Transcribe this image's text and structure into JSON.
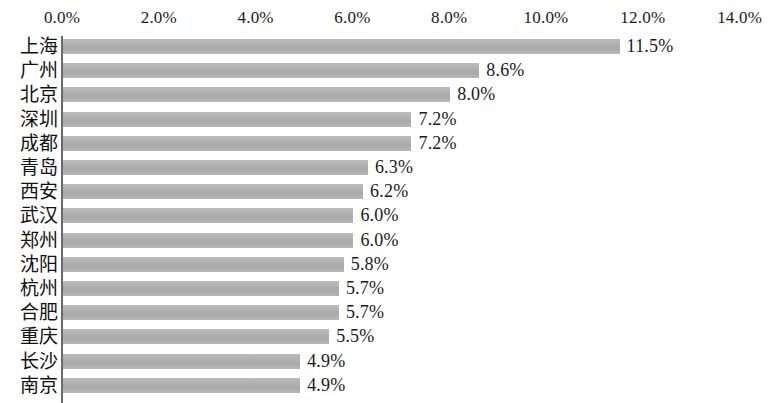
{
  "chart_data": {
    "type": "bar",
    "orientation": "horizontal",
    "title": "",
    "subtitle": "",
    "xlabel": "",
    "ylabel": "",
    "xlim": [
      0,
      14
    ],
    "xtick_labels": [
      "0.0%",
      "2.0%",
      "4.0%",
      "6.0%",
      "8.0%",
      "10.0%",
      "12.0%",
      "14.0%"
    ],
    "xtick_values": [
      0,
      2,
      4,
      6,
      8,
      10,
      12,
      14
    ],
    "grid": false,
    "legend": null,
    "bar_color": "#b2b2b2",
    "axis_color": "#6a6a6a",
    "text_color": "#1a1a1a",
    "categories": [
      "上海",
      "广州",
      "北京",
      "深圳",
      "成都",
      "青岛",
      "西安",
      "武汉",
      "郑州",
      "沈阳",
      "杭州",
      "合肥",
      "重庆",
      "长沙",
      "南京"
    ],
    "values": [
      11.5,
      8.6,
      8.0,
      7.2,
      7.2,
      6.3,
      6.2,
      6.0,
      6.0,
      5.8,
      5.7,
      5.7,
      5.5,
      4.9,
      4.9
    ],
    "value_labels": [
      "11.5%",
      "8.6%",
      "8.0%",
      "7.2%",
      "7.2%",
      "6.3%",
      "6.2%",
      "6.0%",
      "6.0%",
      "5.8%",
      "5.7%",
      "5.7%",
      "5.5%",
      "4.9%",
      "4.9%"
    ],
    "bars": [
      {
        "category": "上海",
        "value": 11.5,
        "label": "11.5%"
      },
      {
        "category": "广州",
        "value": 8.6,
        "label": "8.6%"
      },
      {
        "category": "北京",
        "value": 8.0,
        "label": "8.0%"
      },
      {
        "category": "深圳",
        "value": 7.2,
        "label": "7.2%"
      },
      {
        "category": "成都",
        "value": 7.2,
        "label": "7.2%"
      },
      {
        "category": "青岛",
        "value": 6.3,
        "label": "6.3%"
      },
      {
        "category": "西安",
        "value": 6.2,
        "label": "6.2%"
      },
      {
        "category": "武汉",
        "value": 6.0,
        "label": "6.0%"
      },
      {
        "category": "郑州",
        "value": 6.0,
        "label": "6.0%"
      },
      {
        "category": "沈阳",
        "value": 5.8,
        "label": "5.8%"
      },
      {
        "category": "杭州",
        "value": 5.7,
        "label": "5.7%"
      },
      {
        "category": "合肥",
        "value": 5.7,
        "label": "5.7%"
      },
      {
        "category": "重庆",
        "value": 5.5,
        "label": "5.5%"
      },
      {
        "category": "长沙",
        "value": 4.9,
        "label": "4.9%"
      },
      {
        "category": "南京",
        "value": 4.9,
        "label": "4.9%"
      }
    ]
  }
}
